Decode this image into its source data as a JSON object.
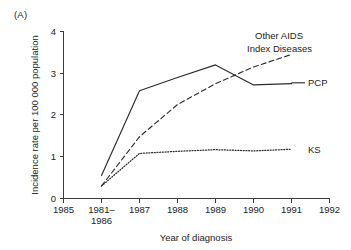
{
  "figure": {
    "panel_label": "(A)"
  },
  "chart_data": {
    "type": "line",
    "title": "",
    "xlabel": "Year of diagnosis",
    "ylabel": "Incidence rate per 100 000 population",
    "grid": false,
    "legend_position": "inline-right-of-series",
    "ylim": [
      0,
      4
    ],
    "yticks": [
      0,
      1,
      2,
      3,
      4
    ],
    "ytick_labels": [
      "0",
      "1",
      "2",
      "3",
      "4"
    ],
    "xtick_labels": [
      "1985",
      "1981–1986",
      "1987",
      "1988",
      "1989",
      "1990",
      "1991",
      "1992"
    ],
    "xtick_labels_multiline": [
      [
        "1985"
      ],
      [
        "1981–",
        "1986"
      ],
      [
        "1987"
      ],
      [
        "1988"
      ],
      [
        "1989"
      ],
      [
        "1990"
      ],
      [
        "1991"
      ],
      [
        "1992"
      ]
    ],
    "categories": [
      "1981–1986",
      "1987",
      "1988",
      "1989",
      "1990",
      "1991"
    ],
    "series": [
      {
        "name": "PCP",
        "style": "solid",
        "color": "#2b2b2b",
        "values": [
          0.55,
          2.58,
          2.9,
          3.2,
          2.72,
          2.75
        ]
      },
      {
        "name": "Other AIDS Index Diseases",
        "style": "dashed",
        "color": "#2b2b2b",
        "values": [
          0.3,
          1.48,
          2.25,
          2.75,
          3.15,
          3.45
        ]
      },
      {
        "name": "KS",
        "style": "dotted",
        "color": "#2b2b2b",
        "values": [
          0.3,
          1.08,
          1.13,
          1.17,
          1.14,
          1.18
        ]
      }
    ],
    "annotations": [
      {
        "text": "Other AIDS",
        "for": "Other AIDS Index Diseases"
      },
      {
        "text": "Index Diseases",
        "for": "Other AIDS Index Diseases"
      },
      {
        "text": "PCP",
        "for": "PCP"
      },
      {
        "text": "KS",
        "for": "KS"
      }
    ]
  }
}
